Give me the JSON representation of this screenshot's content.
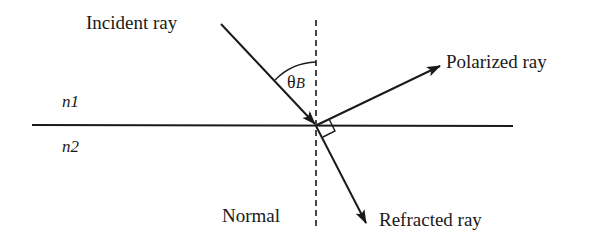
{
  "diagram": {
    "labels": {
      "incident": "Incident ray",
      "polarized": "Polarized ray",
      "refracted": "Refracted ray",
      "normal": "Normal",
      "medium1": "n1",
      "medium2": "n2",
      "angle_symbol": "θ",
      "angle_subscript": "B"
    },
    "colors": {
      "stroke": "#1a1a1a",
      "background": "#ffffff"
    },
    "geometry": {
      "interface": {
        "x1": 32,
        "y1": 125,
        "x2": 513,
        "y2": 126
      },
      "normal": {
        "x": 316,
        "y1": 20,
        "y2": 228,
        "style": "dashed"
      },
      "incident_ray": {
        "x1": 221,
        "y1": 24,
        "x2": 316,
        "y2": 125
      },
      "polarized_ray": {
        "x1": 316,
        "y1": 125,
        "x2": 440,
        "y2": 66
      },
      "refracted_ray": {
        "x1": 316,
        "y1": 125,
        "x2": 366,
        "y2": 223
      },
      "right_angle_marker": true,
      "angle_arc": "between incident ray and normal"
    }
  }
}
